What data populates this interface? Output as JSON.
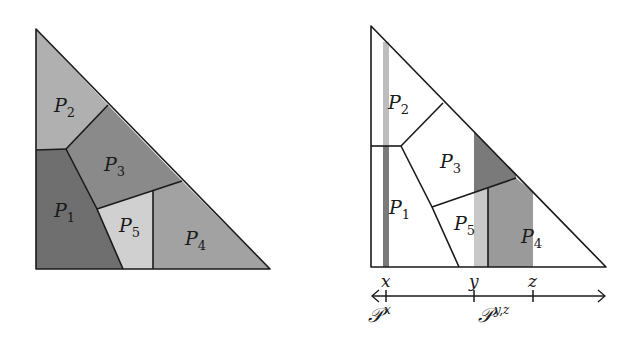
{
  "left_panel": {
    "regions": [
      {
        "id": "P1",
        "name": "P",
        "sub": "1",
        "fill": "#6f6f6f"
      },
      {
        "id": "P2",
        "name": "P",
        "sub": "2",
        "fill": "#b0b0b0"
      },
      {
        "id": "P3",
        "name": "P",
        "sub": "3",
        "fill": "#8a8a8a"
      },
      {
        "id": "P4",
        "name": "P",
        "sub": "4",
        "fill": "#a2a2a2"
      },
      {
        "id": "P5",
        "name": "P",
        "sub": "5",
        "fill": "#d0d0d0"
      }
    ]
  },
  "right_panel": {
    "regions": [
      {
        "id": "P1",
        "name": "P",
        "sub": "1"
      },
      {
        "id": "P2",
        "name": "P",
        "sub": "2"
      },
      {
        "id": "P3",
        "name": "P",
        "sub": "3"
      },
      {
        "id": "P4",
        "name": "P",
        "sub": "4"
      },
      {
        "id": "P5",
        "name": "P",
        "sub": "5"
      }
    ],
    "strip_colors": {
      "light": "#bdbdbd",
      "dark": "#7a7a7a",
      "mid": "#9a9a9a",
      "pale": "#c8c8c8"
    },
    "axis": {
      "ticks": [
        {
          "label": "x",
          "pos": 386
        },
        {
          "label": "y",
          "pos": 474
        },
        {
          "label": "z",
          "pos": 533
        }
      ],
      "family_labels": [
        {
          "script": "𝒫",
          "sup": "x"
        },
        {
          "script": "𝒫",
          "sup": "y,z"
        }
      ]
    }
  }
}
